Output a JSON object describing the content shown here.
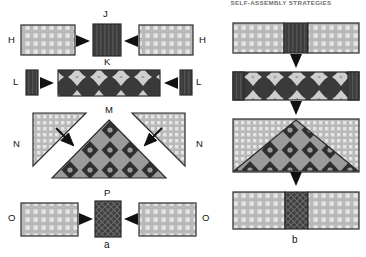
{
  "header": {
    "running_title": "SELF-ASSEMBLY STRATEGIES"
  },
  "panels": [
    {
      "id": "a",
      "label": "a"
    },
    {
      "id": "b",
      "label": "b"
    }
  ],
  "labels": {
    "H_left": "H",
    "H_right": "H",
    "J": "J",
    "K_row2": "K",
    "L_left": "L",
    "L_right": "L",
    "M": "M",
    "N_left": "N",
    "N_right": "N",
    "O_left": "O",
    "O_right": "O",
    "P": "P"
  },
  "rows": [
    {
      "name": "row-H-J",
      "left_piece": "H",
      "center_piece": "J",
      "right_piece": "H",
      "center_label_below": "K",
      "arrow_dir": "horizontal-inward"
    },
    {
      "name": "row-L-K",
      "left_piece": "L",
      "center_piece": "K",
      "right_piece": "L",
      "arrow_dir": "horizontal-inward"
    },
    {
      "name": "row-N-M",
      "left_piece": "N",
      "center_piece": "M",
      "right_piece": "N",
      "arrow_dir": "diagonal-inward"
    },
    {
      "name": "row-O-P",
      "left_piece": "O",
      "center_piece": "P",
      "right_piece": "O",
      "arrow_dir": "horizontal-inward"
    }
  ],
  "assembly_steps": [
    {
      "step": 1,
      "desc": "bar-with-dark-insert"
    },
    {
      "step": 2,
      "desc": "bar-with-star-pattern"
    },
    {
      "step": 3,
      "desc": "rectangle-with-triangle-pattern"
    },
    {
      "step": 4,
      "desc": "bar-with-crosshatch-insert"
    }
  ],
  "colors": {
    "light_fill": "#b9b9b9",
    "light_dot": "#e4e4e4",
    "dark_fill": "#3a3a3a",
    "mid_fill": "#8a8a8a",
    "outline": "#2b2b2b",
    "arrow": "#111111",
    "header_text": "#6f6f72",
    "page_bg": "#ffffff"
  }
}
